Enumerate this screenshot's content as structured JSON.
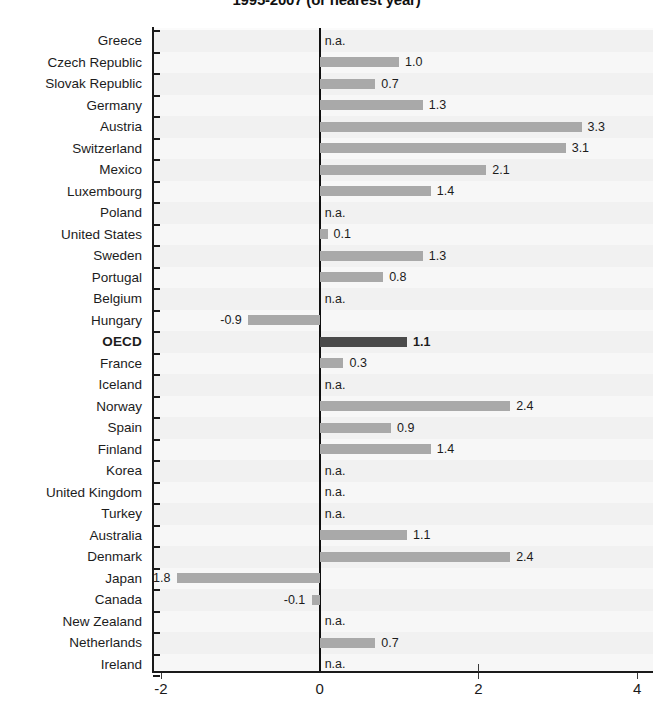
{
  "title": "1995-2007 (or nearest year)",
  "axis": {
    "x_ticks": [
      "-2",
      "0",
      "2",
      "4"
    ],
    "x_tick_values": [
      -2,
      0,
      2,
      4
    ],
    "xmin": -2.1,
    "xmax": 4.2
  },
  "colors": {
    "bar": "#a9a9a9",
    "bar_highlight": "#4a4a4a",
    "axis": "#1a1a1a",
    "plot_background": "#fbfbfb",
    "band": "#f1f1f1"
  },
  "na_text": "n.a.",
  "chart_data": {
    "type": "bar",
    "orientation": "horizontal",
    "title": "1995-2007 (or nearest year)",
    "xlabel": "",
    "ylabel": "",
    "xlim": [
      -2.1,
      4.2
    ],
    "xticks": [
      -2,
      0,
      2,
      4
    ],
    "grid": false,
    "legend": null,
    "highlight_category": "OECD",
    "categories": [
      "Greece",
      "Czech Republic",
      "Slovak Republic",
      "Germany",
      "Austria",
      "Switzerland",
      "Mexico",
      "Luxembourg",
      "Poland",
      "United States",
      "Sweden",
      "Portugal",
      "Belgium",
      "Hungary",
      "OECD",
      "France",
      "Iceland",
      "Norway",
      "Spain",
      "Finland",
      "Korea",
      "United Kingdom",
      "Turkey",
      "Australia",
      "Denmark",
      "Japan",
      "Canada",
      "New Zealand",
      "Netherlands",
      "Ireland"
    ],
    "values": [
      null,
      1.0,
      0.7,
      1.3,
      3.3,
      3.1,
      2.1,
      1.4,
      null,
      0.1,
      1.3,
      0.8,
      null,
      -0.9,
      1.1,
      0.3,
      null,
      2.4,
      0.9,
      1.4,
      null,
      null,
      null,
      1.1,
      2.4,
      -1.8,
      -0.1,
      null,
      0.7,
      null
    ],
    "labels": [
      "n.a.",
      "1.0",
      "0.7",
      "1.3",
      "3.3",
      "3.1",
      "2.1",
      "1.4",
      "n.a.",
      "0.1",
      "1.3",
      "0.8",
      "n.a.",
      "-0.9",
      "1.1",
      "0.3",
      "n.a.",
      "2.4",
      "0.9",
      "1.4",
      "n.a.",
      "n.a.",
      "n.a.",
      "1.1",
      "2.4",
      "-1.8",
      "-0.1",
      "n.a.",
      "0.7",
      "n.a."
    ]
  }
}
